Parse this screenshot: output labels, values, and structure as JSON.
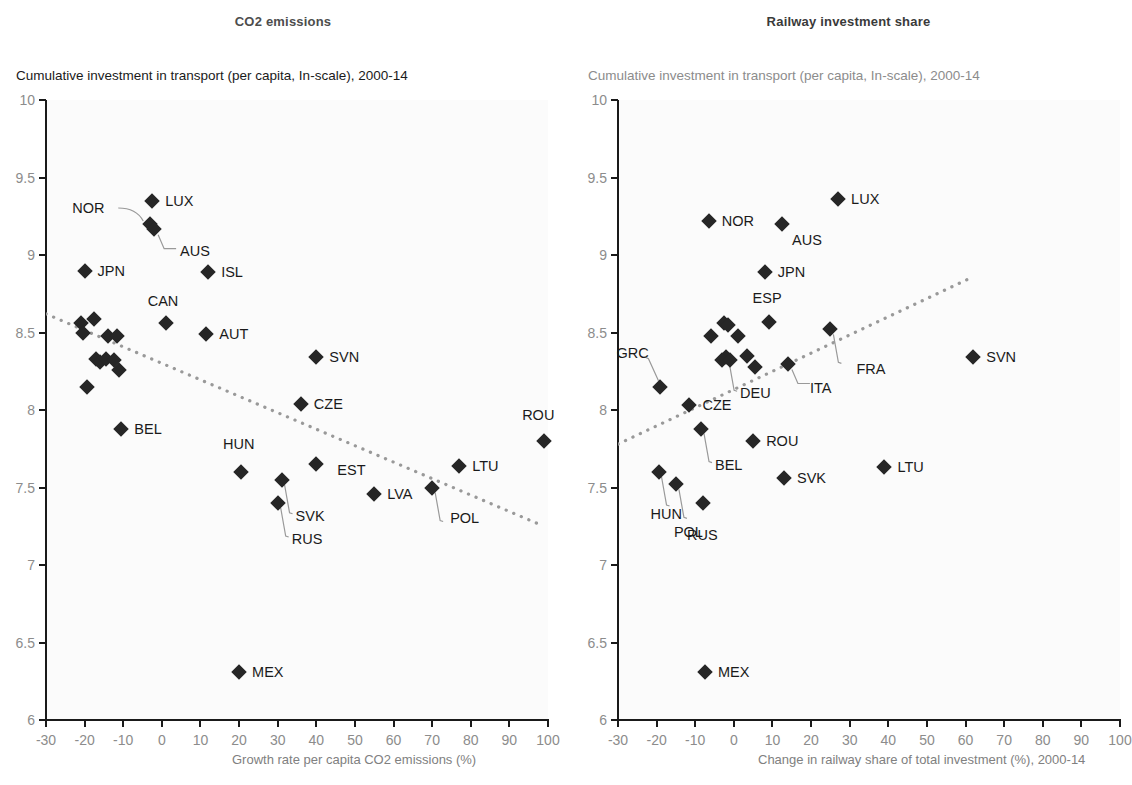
{
  "panels": [
    {
      "id": "co2",
      "title": "CO2 emissions",
      "ylabel": "Cumulative investment in transport (per capita, In-scale), 2000-14",
      "xlabel": "Growth rate per capita CO2 emissions (%)"
    },
    {
      "id": "railway",
      "title": "Railway investment share",
      "ylabel": "Cumulative investment in transport (per capita, In-scale), 2000-14",
      "xlabel": "Change in railway share of total investment (%), 2000-14"
    }
  ],
  "axis": {
    "x_ticks": [
      "-30",
      "-20",
      "-10",
      "0",
      "10",
      "20",
      "30",
      "40",
      "50",
      "60",
      "70",
      "80",
      "90",
      "100"
    ],
    "y_ticks": [
      "10",
      "9.5",
      "9",
      "8.5",
      "8",
      "7.5",
      "7",
      "6.5",
      "6"
    ],
    "xlim": [
      -30,
      100
    ],
    "ylim": [
      6,
      10
    ],
    "marker_color": "#262626",
    "trend_color": "#999999",
    "tick_label_color": "#8c8c8c"
  },
  "chart_data": [
    {
      "type": "scatter",
      "title": "CO2 emissions",
      "xlabel": "Growth rate per capita CO2 emissions (%)",
      "ylabel": "Cumulative investment in transport (per capita, In-scale), 2000-14",
      "xlim": [
        -30,
        100
      ],
      "ylim": [
        6,
        10
      ],
      "grid": false,
      "legend": "none",
      "trendline": {
        "x0": -30,
        "y0": 8.62,
        "x1": 98,
        "y1": 7.26,
        "style": "dotted"
      },
      "points": [
        {
          "label": "LUX",
          "x": -2.5,
          "y": 9.35,
          "label_pos": "right"
        },
        {
          "label": "NOR",
          "x": -3.0,
          "y": 9.2,
          "label_pos": "leader-left"
        },
        {
          "label": "AUS",
          "x": -2.0,
          "y": 9.17,
          "label_pos": "leader-right"
        },
        {
          "label": "JPN",
          "x": -20.0,
          "y": 8.9,
          "label_pos": "right"
        },
        {
          "label": "ISL",
          "x": 12.0,
          "y": 8.89,
          "label_pos": "right"
        },
        {
          "label": "CAN",
          "x": 1.0,
          "y": 8.56,
          "label_pos": "above"
        },
        {
          "label": "AUT",
          "x": 11.5,
          "y": 8.49,
          "label_pos": "right"
        },
        {
          "label": "SVN",
          "x": 40.0,
          "y": 8.34,
          "label_pos": "right"
        },
        {
          "label": "CZE",
          "x": 36.0,
          "y": 8.04,
          "label_pos": "right"
        },
        {
          "label": "BEL",
          "x": -10.5,
          "y": 7.88,
          "label_pos": "right"
        },
        {
          "label": "ROU",
          "x": 99.0,
          "y": 7.8,
          "label_pos": "above"
        },
        {
          "label": "HUN",
          "x": 20.5,
          "y": 7.6,
          "label_pos": "above"
        },
        {
          "label": "EST",
          "x": 40.0,
          "y": 7.65,
          "label_pos": "right"
        },
        {
          "label": "LTU",
          "x": 77.0,
          "y": 7.64,
          "label_pos": "right"
        },
        {
          "label": "SVK",
          "x": 31.0,
          "y": 7.55,
          "label_pos": "leader-below"
        },
        {
          "label": "RUS",
          "x": 30.0,
          "y": 7.4,
          "label_pos": "leader-below"
        },
        {
          "label": "LVA",
          "x": 55.0,
          "y": 7.46,
          "label_pos": "right"
        },
        {
          "label": "POL",
          "x": 70.0,
          "y": 7.5,
          "label_pos": "leader-below"
        },
        {
          "label": "MEX",
          "x": 20.0,
          "y": 6.31,
          "label_pos": "right"
        },
        {
          "label": "",
          "x": -21.0,
          "y": 8.56,
          "label_pos": "none"
        },
        {
          "label": "",
          "x": -20.5,
          "y": 8.5,
          "label_pos": "none"
        },
        {
          "label": "",
          "x": -17.5,
          "y": 8.59,
          "label_pos": "none"
        },
        {
          "label": "",
          "x": -14.0,
          "y": 8.48,
          "label_pos": "none"
        },
        {
          "label": "",
          "x": -11.5,
          "y": 8.48,
          "label_pos": "none"
        },
        {
          "label": "",
          "x": -17.0,
          "y": 8.33,
          "label_pos": "none"
        },
        {
          "label": "",
          "x": -16.0,
          "y": 8.31,
          "label_pos": "none"
        },
        {
          "label": "",
          "x": -14.5,
          "y": 8.33,
          "label_pos": "none"
        },
        {
          "label": "",
          "x": -12.5,
          "y": 8.32,
          "label_pos": "none"
        },
        {
          "label": "",
          "x": -11.0,
          "y": 8.26,
          "label_pos": "none"
        },
        {
          "label": "",
          "x": -19.5,
          "y": 8.15,
          "label_pos": "none"
        }
      ]
    },
    {
      "type": "scatter",
      "title": "Railway investment share",
      "xlabel": "Change in railway share of total investment (%), 2000-14",
      "ylabel": "Cumulative investment in transport (per capita, In-scale), 2000-14",
      "xlim": [
        -30,
        100
      ],
      "ylim": [
        6,
        10
      ],
      "grid": false,
      "legend": "none",
      "trendline": {
        "x0": -30,
        "y0": 7.78,
        "x1": 62,
        "y1": 8.86,
        "style": "dotted"
      },
      "points": [
        {
          "label": "LUX",
          "x": 27.0,
          "y": 9.36,
          "label_pos": "right"
        },
        {
          "label": "NOR",
          "x": -6.5,
          "y": 9.22,
          "label_pos": "right"
        },
        {
          "label": "AUS",
          "x": 12.5,
          "y": 9.2,
          "label_pos": "right-below"
        },
        {
          "label": "JPN",
          "x": 8.0,
          "y": 8.89,
          "label_pos": "right"
        },
        {
          "label": "ESP",
          "x": 9.0,
          "y": 8.57,
          "label_pos": "above"
        },
        {
          "label": "FRA",
          "x": 25.0,
          "y": 8.52,
          "label_pos": "leader-below"
        },
        {
          "label": "ITA",
          "x": 14.0,
          "y": 8.3,
          "label_pos": "leader-right"
        },
        {
          "label": "GRC",
          "x": -19.0,
          "y": 8.15,
          "label_pos": "leader-above"
        },
        {
          "label": "CZE",
          "x": -11.5,
          "y": 8.03,
          "label_pos": "right"
        },
        {
          "label": "DEU",
          "x": -2.0,
          "y": 8.34,
          "label_pos": "leader-below"
        },
        {
          "label": "SVN",
          "x": 62.0,
          "y": 8.34,
          "label_pos": "right"
        },
        {
          "label": "ROU",
          "x": 5.0,
          "y": 7.8,
          "label_pos": "right"
        },
        {
          "label": "BEL",
          "x": -8.5,
          "y": 7.88,
          "label_pos": "leader-below"
        },
        {
          "label": "HUN",
          "x": -19.5,
          "y": 7.6,
          "label_pos": "leader-below"
        },
        {
          "label": "POL",
          "x": -15.0,
          "y": 7.52,
          "label_pos": "leader-below"
        },
        {
          "label": "RUS",
          "x": -8.0,
          "y": 7.4,
          "label_pos": "below"
        },
        {
          "label": "SVK",
          "x": 13.0,
          "y": 7.56,
          "label_pos": "right"
        },
        {
          "label": "LTU",
          "x": 39.0,
          "y": 7.63,
          "label_pos": "right"
        },
        {
          "label": "MEX",
          "x": -7.5,
          "y": 6.31,
          "label_pos": "right"
        },
        {
          "label": "",
          "x": -2.5,
          "y": 8.56,
          "label_pos": "none"
        },
        {
          "label": "",
          "x": -1.5,
          "y": 8.55,
          "label_pos": "none"
        },
        {
          "label": "",
          "x": -6.0,
          "y": 8.48,
          "label_pos": "none"
        },
        {
          "label": "",
          "x": 1.0,
          "y": 8.48,
          "label_pos": "none"
        },
        {
          "label": "",
          "x": -3.0,
          "y": 8.32,
          "label_pos": "none"
        },
        {
          "label": "",
          "x": -1.0,
          "y": 8.32,
          "label_pos": "none"
        },
        {
          "label": "",
          "x": 3.5,
          "y": 8.35,
          "label_pos": "none"
        },
        {
          "label": "",
          "x": 5.5,
          "y": 8.28,
          "label_pos": "none"
        }
      ]
    }
  ]
}
